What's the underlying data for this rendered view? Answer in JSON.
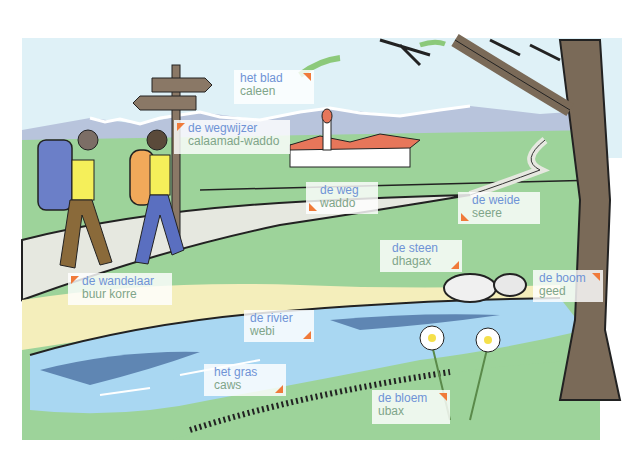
{
  "scene": {
    "description": "Illustrated vocabulary picture: hikers on a path near a river with a tree, village and meadow",
    "colors": {
      "sky": "#dff1f7",
      "grass": "#9dd39a",
      "path": "#e6e8e0",
      "water_light": "#a9d7f2",
      "water_dark": "#5f86b3",
      "sand": "#f4eebb",
      "tree": "#7a6a58",
      "label_dutch": "#6f93d6",
      "label_somali": "#7fa589",
      "marker": "#f07a3a"
    }
  },
  "labels": [
    {
      "id": "leaf",
      "dutch": "het blad",
      "somali": "caleen"
    },
    {
      "id": "signpost",
      "dutch": "de wegwijzer",
      "somali": "calaamad-waddo"
    },
    {
      "id": "road",
      "dutch": "de weg",
      "somali": "waddo"
    },
    {
      "id": "meadow",
      "dutch": "de weide",
      "somali": "seere"
    },
    {
      "id": "stone",
      "dutch": "de steen",
      "somali": "dhagax"
    },
    {
      "id": "hiker",
      "dutch": "de wandelaar",
      "somali": "buur korre"
    },
    {
      "id": "tree",
      "dutch": "de boom",
      "somali": "geed"
    },
    {
      "id": "river",
      "dutch": "de rivier",
      "somali": "webi"
    },
    {
      "id": "grass",
      "dutch": "het gras",
      "somali": "caws"
    },
    {
      "id": "flower",
      "dutch": "de bloem",
      "somali": "ubax"
    }
  ]
}
